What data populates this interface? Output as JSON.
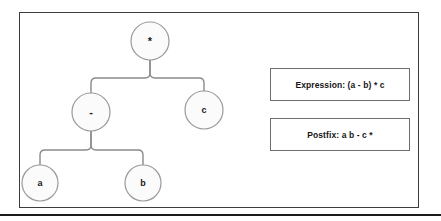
{
  "figure": {
    "panel_name": "expression-tree-figure",
    "background_color": "#ffffff",
    "border_color": "#3c3c3c",
    "rule_color": "#1c1c1c"
  },
  "tree": {
    "node_fill": "#fbfbfb",
    "node_stroke": "#9a9a9a",
    "edge_color": "#8a8a8a",
    "nodes": [
      {
        "id": "root",
        "label": "*",
        "kind": "operator",
        "cx": 150,
        "cy": 41,
        "r": 19
      },
      {
        "id": "minus",
        "label": "-",
        "kind": "operator",
        "cx": 91,
        "cy": 112,
        "r": 19
      },
      {
        "id": "c",
        "label": "c",
        "kind": "operand",
        "cx": 204,
        "cy": 110,
        "r": 19
      },
      {
        "id": "a",
        "label": "a",
        "kind": "operand",
        "cx": 40,
        "cy": 183,
        "r": 18
      },
      {
        "id": "b",
        "label": "b",
        "kind": "operand",
        "cx": 143,
        "cy": 183,
        "r": 18
      }
    ],
    "edges": [
      {
        "from": "root",
        "to": "minus"
      },
      {
        "from": "root",
        "to": "c"
      },
      {
        "from": "minus",
        "to": "a"
      },
      {
        "from": "minus",
        "to": "b"
      }
    ]
  },
  "info": {
    "expression": "Expression: (a - b) * c",
    "postfix": "Postfix: a b - c *"
  }
}
